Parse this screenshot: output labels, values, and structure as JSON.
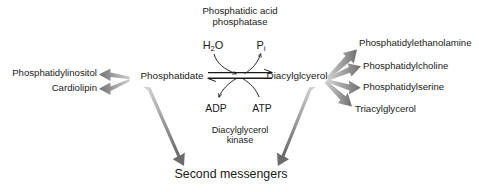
{
  "diagram": {
    "title_enzyme": "Phosphatidic acid\nphosphatase",
    "enzyme_upper_line1": "Phosphatidic acid",
    "enzyme_upper_line2": "phosphatase",
    "enzyme_lower_line1": "Diacylglycerol",
    "enzyme_lower_line2": "kinase",
    "substrate_water": "H",
    "substrate_water_sub": "2",
    "substrate_water_tail": "O",
    "product_phosphate": "P",
    "product_phosphate_sub": "i",
    "nucleotide_left": "ADP",
    "nucleotide_right": "ATP",
    "node_left": "Phosphatidate",
    "node_right": "Diacylglcyerol",
    "terminal": "Second messengers",
    "left_products": [
      {
        "label": "Phosphatidylinositol"
      },
      {
        "label": "Cardiolipin"
      }
    ],
    "right_products": [
      {
        "label": "Phosphatidylethanolamine"
      },
      {
        "label": "Phosphatidylcholine"
      },
      {
        "label": "Phosphatidylserine"
      },
      {
        "label": "Triacylglycerol"
      }
    ],
    "colors": {
      "background": "#ffffff",
      "text": "#1a1a1a",
      "thick_arrow_dark": "#6e6e6e",
      "thick_arrow_light": "#c9c9c9",
      "thin_arrow": "#1a1a1a"
    }
  }
}
